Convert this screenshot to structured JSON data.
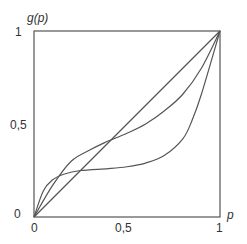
{
  "chart_data": {
    "type": "line",
    "title": "",
    "xlabel": "p",
    "ylabel": "g(p)",
    "xlim": [
      0,
      1
    ],
    "ylim": [
      0,
      1
    ],
    "grid": false,
    "legend": null,
    "x_ticks": [
      "0",
      "0,5",
      "1"
    ],
    "y_ticks": [
      "0",
      "0,5",
      "1"
    ],
    "series": [
      {
        "name": "diagonal",
        "x": [
          0,
          1
        ],
        "y": [
          0,
          1
        ]
      },
      {
        "name": "curve-a",
        "x": [
          0,
          0.1,
          0.2,
          0.3,
          0.38,
          0.5,
          0.6,
          0.7,
          0.8,
          0.9,
          1.0
        ],
        "y": [
          0,
          0.17,
          0.3,
          0.36,
          0.4,
          0.45,
          0.5,
          0.57,
          0.66,
          0.8,
          1.0
        ]
      },
      {
        "name": "curve-b",
        "x": [
          0,
          0.05,
          0.1,
          0.16,
          0.25,
          0.4,
          0.5,
          0.6,
          0.7,
          0.8,
          0.85,
          0.9,
          1.0
        ],
        "y": [
          0,
          0.14,
          0.2,
          0.23,
          0.25,
          0.26,
          0.27,
          0.29,
          0.33,
          0.42,
          0.52,
          0.66,
          1.0
        ]
      }
    ]
  }
}
